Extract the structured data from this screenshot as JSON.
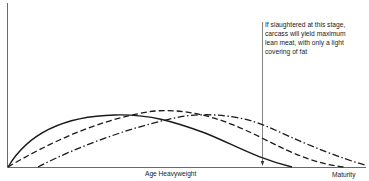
{
  "diagram": {
    "annotation": {
      "lines": [
        "If slaughtered at this stage,",
        "carcass will yield maximum",
        "lean meat, with only a light",
        "covering of fat"
      ]
    },
    "x_axis": {
      "labels": [
        "Age Heavyweight",
        "Maturity"
      ]
    },
    "curves": [
      {
        "name": "solid-curve",
        "style": "solid"
      },
      {
        "name": "dashed-curve",
        "style": "dashed"
      },
      {
        "name": "dash-dot-curve",
        "style": "dash-dot"
      }
    ],
    "colors": {
      "line": "#1a1a1a",
      "background": "#ffffff"
    }
  }
}
